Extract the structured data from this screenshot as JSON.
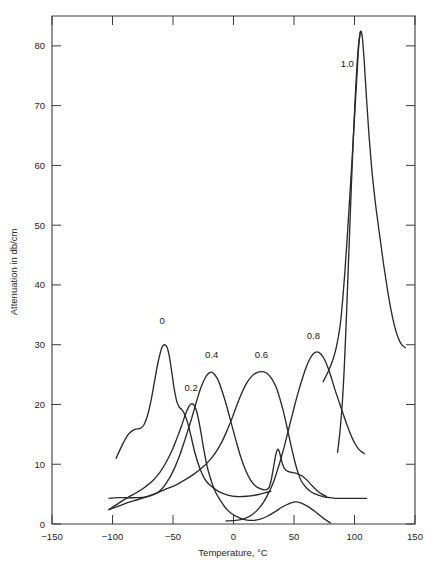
{
  "chart_data": {
    "type": "line",
    "title": "",
    "xlabel": "Temperature, °C",
    "ylabel": "Attenuation in db/cm",
    "xlim": [
      -150,
      150
    ],
    "ylim": [
      0,
      85
    ],
    "xticks": [
      -150,
      -100,
      -50,
      0,
      50,
      100,
      150
    ],
    "xtick_labels": [
      "−150",
      "−100",
      "−50",
      "0",
      "50",
      "100",
      "150"
    ],
    "yticks": [
      0,
      10,
      20,
      30,
      40,
      50,
      60,
      70,
      80
    ],
    "ytick_labels": [
      "0",
      "10",
      "20",
      "30",
      "40",
      "50",
      "60",
      "70",
      "80"
    ],
    "grid": false,
    "legend": "inline-curve-labels",
    "series": [
      {
        "name": "0",
        "label": "0",
        "label_x": -59,
        "label_y": 33.5,
        "peak_x": -58,
        "peak_y": 30.0,
        "points": [
          [
            -97,
            11.0
          ],
          [
            -92,
            13.2
          ],
          [
            -87,
            15.0
          ],
          [
            -82,
            15.8
          ],
          [
            -77,
            16.0
          ],
          [
            -74,
            16.6
          ],
          [
            -71,
            18.2
          ],
          [
            -68,
            20.8
          ],
          [
            -65,
            24.2
          ],
          [
            -62,
            27.4
          ],
          [
            -59,
            29.6
          ],
          [
            -57,
            30.0
          ],
          [
            -55,
            29.6
          ],
          [
            -53,
            28.0
          ],
          [
            -51,
            25.4
          ],
          [
            -49,
            22.6
          ],
          [
            -47,
            20.6
          ],
          [
            -45,
            19.6
          ],
          [
            -43,
            19.2
          ],
          [
            -41,
            18.6
          ],
          [
            -38,
            17.0
          ],
          [
            -35,
            14.6
          ],
          [
            -32,
            12.0
          ],
          [
            -28,
            9.4
          ],
          [
            -24,
            7.6
          ],
          [
            -20,
            6.6
          ],
          [
            -15,
            5.8
          ],
          [
            -10,
            5.2
          ],
          [
            -4,
            4.8
          ],
          [
            2,
            4.6
          ],
          [
            8,
            4.6
          ],
          [
            14,
            4.7
          ],
          [
            20,
            4.9
          ],
          [
            26,
            5.2
          ],
          [
            31,
            5.5
          ]
        ]
      },
      {
        "name": "0.2",
        "label": "0.2",
        "label_x": -35,
        "label_y": 22.3,
        "peak_x": -35,
        "peak_y": 20.1,
        "points": [
          [
            -103,
            2.4
          ],
          [
            -97,
            3.2
          ],
          [
            -91,
            4.0
          ],
          [
            -85,
            4.7
          ],
          [
            -79,
            5.4
          ],
          [
            -73,
            6.2
          ],
          [
            -67,
            7.2
          ],
          [
            -61,
            8.6
          ],
          [
            -56,
            10.2
          ],
          [
            -51,
            12.2
          ],
          [
            -47,
            14.2
          ],
          [
            -43,
            16.4
          ],
          [
            -40,
            18.2
          ],
          [
            -37,
            19.6
          ],
          [
            -35,
            20.1
          ],
          [
            -33,
            20.0
          ],
          [
            -31,
            19.2
          ],
          [
            -29,
            17.6
          ],
          [
            -27,
            15.4
          ],
          [
            -25,
            13.0
          ],
          [
            -23,
            10.8
          ],
          [
            -21,
            9.0
          ],
          [
            -18,
            7.0
          ],
          [
            -15,
            5.4
          ],
          [
            -11,
            4.0
          ],
          [
            -7,
            2.8
          ],
          [
            -2,
            1.8
          ],
          [
            4,
            1.1
          ],
          [
            10,
            0.7
          ],
          [
            16,
            0.6
          ],
          [
            22,
            0.8
          ],
          [
            28,
            1.3
          ],
          [
            34,
            2.0
          ],
          [
            40,
            2.8
          ],
          [
            46,
            3.4
          ],
          [
            51,
            3.7
          ],
          [
            56,
            3.5
          ],
          [
            61,
            3.0
          ],
          [
            66,
            2.3
          ],
          [
            71,
            1.5
          ],
          [
            76,
            0.7
          ],
          [
            80,
            0.2
          ]
        ]
      },
      {
        "name": "0.4",
        "label": "0.4",
        "label_x": -18,
        "label_y": 27.7,
        "peak_x": -18,
        "peak_y": 25.4,
        "points": [
          [
            -103,
            4.3
          ],
          [
            -95,
            4.4
          ],
          [
            -87,
            4.4
          ],
          [
            -80,
            4.4
          ],
          [
            -73,
            4.5
          ],
          [
            -66,
            4.9
          ],
          [
            -60,
            5.7
          ],
          [
            -55,
            7.0
          ],
          [
            -50,
            8.8
          ],
          [
            -45,
            11.2
          ],
          [
            -40,
            14.2
          ],
          [
            -35,
            17.4
          ],
          [
            -31,
            20.2
          ],
          [
            -27,
            22.8
          ],
          [
            -23,
            24.6
          ],
          [
            -20,
            25.3
          ],
          [
            -18,
            25.4
          ],
          [
            -16,
            25.1
          ],
          [
            -13,
            24.2
          ],
          [
            -10,
            22.6
          ],
          [
            -6,
            20.0
          ],
          [
            -2,
            17.0
          ],
          [
            2,
            14.0
          ],
          [
            6,
            11.2
          ],
          [
            10,
            9.0
          ],
          [
            14,
            7.4
          ],
          [
            18,
            6.4
          ],
          [
            22,
            5.9
          ],
          [
            26,
            5.7
          ],
          [
            29,
            6.0
          ],
          [
            31,
            7.2
          ],
          [
            33,
            9.4
          ],
          [
            35,
            11.6
          ],
          [
            36.5,
            12.5
          ],
          [
            38,
            12.0
          ],
          [
            40,
            10.4
          ],
          [
            42,
            9.3
          ],
          [
            45,
            8.8
          ],
          [
            49,
            8.6
          ],
          [
            53,
            8.4
          ],
          [
            57,
            8.0
          ],
          [
            61,
            7.3
          ],
          [
            65,
            6.4
          ],
          [
            69,
            5.6
          ],
          [
            73,
            5.0
          ],
          [
            77,
            4.6
          ]
        ]
      },
      {
        "name": "0.6",
        "label": "0.6",
        "label_x": 23,
        "label_y": 27.8,
        "peak_x": 25,
        "peak_y": 25.5,
        "points": [
          [
            -103,
            2.4
          ],
          [
            -95,
            3.0
          ],
          [
            -87,
            3.6
          ],
          [
            -79,
            4.1
          ],
          [
            -71,
            4.6
          ],
          [
            -63,
            5.2
          ],
          [
            -55,
            5.9
          ],
          [
            -47,
            6.6
          ],
          [
            -40,
            7.4
          ],
          [
            -33,
            8.3
          ],
          [
            -26,
            9.4
          ],
          [
            -20,
            10.6
          ],
          [
            -14,
            12.2
          ],
          [
            -9,
            14.0
          ],
          [
            -5,
            15.8
          ],
          [
            -1,
            17.8
          ],
          [
            3,
            20.0
          ],
          [
            7,
            22.0
          ],
          [
            11,
            23.6
          ],
          [
            15,
            24.7
          ],
          [
            19,
            25.3
          ],
          [
            23,
            25.5
          ],
          [
            27,
            25.3
          ],
          [
            31,
            24.5
          ],
          [
            35,
            23.0
          ],
          [
            38,
            21.2
          ],
          [
            41,
            19.0
          ],
          [
            44,
            16.4
          ],
          [
            47,
            13.6
          ],
          [
            50,
            11.0
          ],
          [
            53,
            8.8
          ],
          [
            56,
            7.2
          ],
          [
            60,
            6.1
          ],
          [
            64,
            5.4
          ],
          [
            68,
            5.0
          ],
          [
            72,
            4.7
          ],
          [
            76,
            4.5
          ],
          [
            80,
            4.4
          ],
          [
            84,
            4.3
          ],
          [
            88,
            4.3
          ],
          [
            92,
            4.3
          ],
          [
            96,
            4.3
          ],
          [
            100,
            4.3
          ],
          [
            105,
            4.3
          ],
          [
            110,
            4.3
          ]
        ]
      },
      {
        "name": "0.8",
        "label": "0.8",
        "label_x": 66,
        "label_y": 31.0,
        "peak_x": 68,
        "peak_y": 28.8,
        "points": [
          [
            -6,
            0.5
          ],
          [
            2,
            0.6
          ],
          [
            9,
            0.9
          ],
          [
            15,
            1.5
          ],
          [
            20,
            2.4
          ],
          [
            25,
            3.7
          ],
          [
            29,
            5.2
          ],
          [
            33,
            7.0
          ],
          [
            36,
            8.8
          ],
          [
            39,
            10.8
          ],
          [
            42,
            13.0
          ],
          [
            45,
            15.4
          ],
          [
            48,
            17.8
          ],
          [
            51,
            20.2
          ],
          [
            54,
            22.4
          ],
          [
            57,
            24.4
          ],
          [
            60,
            26.2
          ],
          [
            63,
            27.6
          ],
          [
            66,
            28.5
          ],
          [
            69,
            28.8
          ],
          [
            72,
            28.5
          ],
          [
            75,
            27.6
          ],
          [
            78,
            26.2
          ],
          [
            81,
            24.4
          ],
          [
            84,
            22.4
          ],
          [
            88,
            20.0
          ],
          [
            92,
            17.6
          ],
          [
            96,
            15.4
          ],
          [
            100,
            13.6
          ],
          [
            104,
            12.4
          ],
          [
            108,
            11.8
          ]
        ]
      },
      {
        "name": "1.0",
        "label": "1.0",
        "label_x": 94,
        "label_y": 76.5,
        "peak_x": 105,
        "peak_y": 82.4,
        "points": [
          [
            74,
            23.8
          ],
          [
            78,
            25.4
          ],
          [
            82,
            27.4
          ],
          [
            85,
            29.6
          ],
          [
            88,
            33.0
          ],
          [
            90,
            37.0
          ],
          [
            92,
            42.0
          ],
          [
            94,
            48.0
          ],
          [
            96,
            54.5
          ],
          [
            98,
            61.0
          ],
          [
            100,
            68.0
          ],
          [
            102,
            75.0
          ],
          [
            103.5,
            80.0
          ],
          [
            105,
            82.4
          ],
          [
            106.5,
            81.4
          ],
          [
            108,
            77.5
          ],
          [
            110,
            71.0
          ],
          [
            112,
            65.0
          ],
          [
            114,
            60.0
          ],
          [
            116,
            56.0
          ],
          [
            118,
            52.5
          ],
          [
            121,
            48.0
          ],
          [
            124,
            43.5
          ],
          [
            127,
            39.5
          ],
          [
            130,
            36.0
          ],
          [
            133,
            33.2
          ],
          [
            136,
            31.2
          ],
          [
            139,
            30.0
          ],
          [
            142,
            29.5
          ]
        ]
      },
      {
        "name": "1.0-lower-leg",
        "label": "",
        "points": [
          [
            86,
            12.0
          ],
          [
            88,
            15.5
          ],
          [
            90,
            20.5
          ],
          [
            91.5,
            26.0
          ],
          [
            93,
            33.0
          ],
          [
            94.5,
            41.0
          ],
          [
            96,
            49.0
          ],
          [
            97.5,
            57.0
          ],
          [
            99,
            64.5
          ],
          [
            100.5,
            71.0
          ],
          [
            102,
            76.5
          ],
          [
            103.5,
            80.5
          ],
          [
            105,
            82.4
          ]
        ]
      }
    ]
  }
}
